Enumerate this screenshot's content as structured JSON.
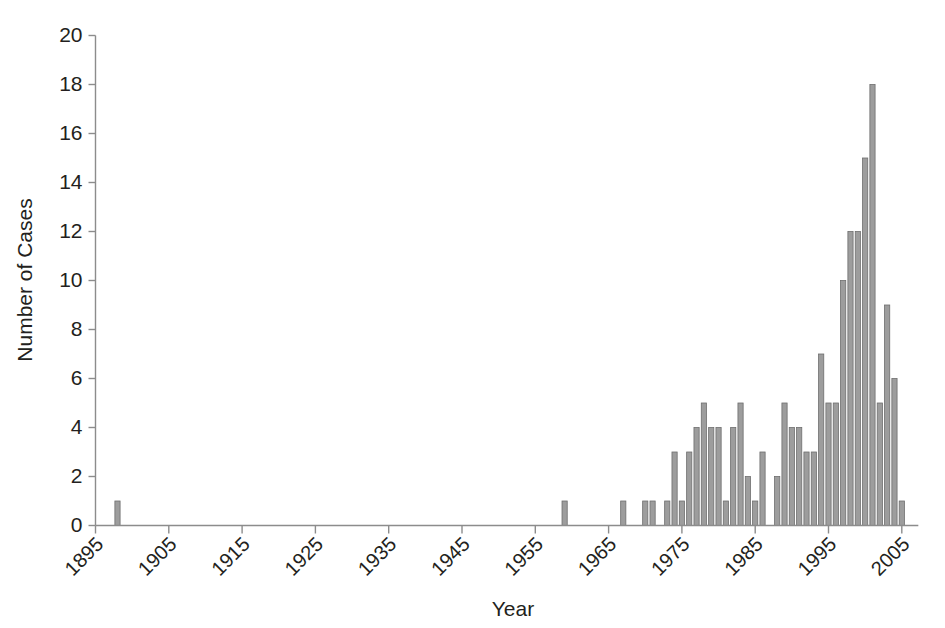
{
  "chart_data": {
    "type": "bar",
    "title": "",
    "subtitle": "",
    "xlabel": "Year",
    "ylabel": "Number of Cases",
    "xlim": [
      1894,
      2007
    ],
    "ylim": [
      0,
      20
    ],
    "grid": false,
    "legend": null,
    "bar_color": "#9d9d9d",
    "bar_edge_color": "#6e6e6e",
    "axis_color": "#8c8c8c",
    "text_color": "#231f20",
    "x_tick_labels": [
      "1895",
      "1905",
      "1915",
      "1925",
      "1935",
      "1945",
      "1955",
      "1965",
      "1975",
      "1985",
      "1995",
      "2005"
    ],
    "x_tick_values": [
      1895,
      1905,
      1915,
      1925,
      1935,
      1945,
      1955,
      1965,
      1975,
      1985,
      1995,
      2005
    ],
    "x_tick_label_rotation": -45,
    "y_tick_labels": [
      "0",
      "2",
      "4",
      "6",
      "8",
      "10",
      "12",
      "14",
      "16",
      "18",
      "20"
    ],
    "y_tick_values": [
      0,
      2,
      4,
      6,
      8,
      10,
      12,
      14,
      16,
      18,
      20
    ],
    "categories": [
      1895,
      1896,
      1897,
      1898,
      1899,
      1900,
      1901,
      1902,
      1903,
      1904,
      1905,
      1906,
      1907,
      1908,
      1909,
      1910,
      1911,
      1912,
      1913,
      1914,
      1915,
      1916,
      1917,
      1918,
      1919,
      1920,
      1921,
      1922,
      1923,
      1924,
      1925,
      1926,
      1927,
      1928,
      1929,
      1930,
      1931,
      1932,
      1933,
      1934,
      1935,
      1936,
      1937,
      1938,
      1939,
      1940,
      1941,
      1942,
      1943,
      1944,
      1945,
      1946,
      1947,
      1948,
      1949,
      1950,
      1951,
      1952,
      1953,
      1954,
      1955,
      1956,
      1957,
      1958,
      1959,
      1960,
      1961,
      1962,
      1963,
      1964,
      1965,
      1966,
      1967,
      1968,
      1969,
      1970,
      1971,
      1972,
      1973,
      1974,
      1975,
      1976,
      1977,
      1978,
      1979,
      1980,
      1981,
      1982,
      1983,
      1984,
      1985,
      1986,
      1987,
      1988,
      1989,
      1990,
      1991,
      1992,
      1993,
      1994,
      1995,
      1996,
      1997,
      1998,
      1999,
      2000,
      2001,
      2002,
      2003,
      2004,
      2005,
      2006
    ],
    "values": [
      0,
      0,
      0,
      1,
      0,
      0,
      0,
      0,
      0,
      0,
      0,
      0,
      0,
      0,
      0,
      0,
      0,
      0,
      0,
      0,
      0,
      0,
      0,
      0,
      0,
      0,
      0,
      0,
      0,
      0,
      0,
      0,
      0,
      0,
      0,
      0,
      0,
      0,
      0,
      0,
      0,
      0,
      0,
      0,
      0,
      0,
      0,
      0,
      0,
      0,
      0,
      0,
      0,
      0,
      0,
      0,
      0,
      0,
      0,
      0,
      0,
      0,
      0,
      0,
      1,
      0,
      0,
      0,
      0,
      0,
      0,
      0,
      1,
      0,
      0,
      1,
      1,
      0,
      1,
      3,
      1,
      3,
      4,
      5,
      4,
      4,
      1,
      4,
      5,
      2,
      1,
      3,
      0,
      2,
      5,
      4,
      4,
      3,
      3,
      7,
      5,
      5,
      10,
      12,
      12,
      15,
      18,
      5,
      9,
      6,
      1,
      0
    ]
  },
  "notes": {
    "peak_year": "2001",
    "peak_value": "18"
  }
}
